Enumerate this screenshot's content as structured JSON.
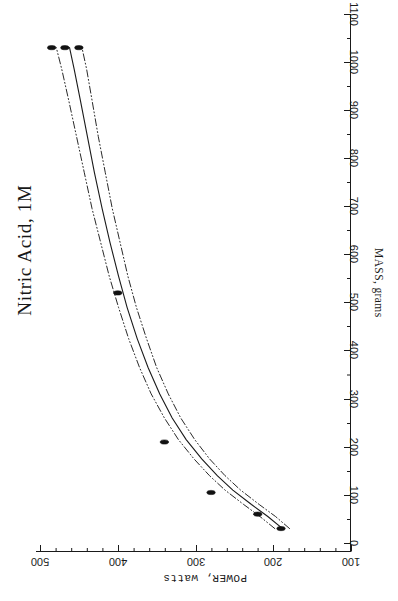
{
  "chart_data": {
    "type": "line",
    "title": "Nitric Acid, 1M",
    "xlabel": "POWER, watts",
    "ylabel": "MASS, grams",
    "orientation": "rotated-90-counterclockwise",
    "grid": false,
    "legend": "none",
    "xlabel_axis": "bottom",
    "ylabel_axis": "right",
    "xlim": [
      100,
      500
    ],
    "ylim": [
      0,
      1100
    ],
    "x_ticks": [
      500,
      400,
      300,
      200,
      100
    ],
    "x_tick_labels": [
      "500",
      "400",
      "300",
      "200",
      "100"
    ],
    "x_tick_direction": "decreasing-left-to-right",
    "y_ticks": [
      0,
      100,
      200,
      300,
      400,
      500,
      600,
      700,
      800,
      900,
      1000,
      1100
    ],
    "y_tick_labels": [
      "0",
      "100",
      "200",
      "300",
      "400",
      "500",
      "600",
      "700",
      "800",
      "900",
      "1000",
      "1100"
    ],
    "y_tick_direction": "increasing-bottom-to-top",
    "minor_ticks": true,
    "series": [
      {
        "name": "fit",
        "style": "solid",
        "color": "#1a1a1a",
        "points": [
          {
            "power": 188,
            "mass": 30
          },
          {
            "power": 207,
            "mass": 55
          },
          {
            "power": 228,
            "mass": 80
          },
          {
            "power": 252,
            "mass": 110
          },
          {
            "power": 272,
            "mass": 140
          },
          {
            "power": 292,
            "mass": 175
          },
          {
            "power": 312,
            "mass": 215
          },
          {
            "power": 330,
            "mass": 260
          },
          {
            "power": 346,
            "mass": 310
          },
          {
            "power": 361,
            "mass": 365
          },
          {
            "power": 375,
            "mass": 425
          },
          {
            "power": 388,
            "mass": 490
          },
          {
            "power": 399,
            "mass": 555
          },
          {
            "power": 410,
            "mass": 625
          },
          {
            "power": 420,
            "mass": 695
          },
          {
            "power": 430,
            "mass": 770
          },
          {
            "power": 439,
            "mass": 845
          },
          {
            "power": 448,
            "mass": 920
          },
          {
            "power": 456,
            "mass": 985
          },
          {
            "power": 462,
            "mass": 1030
          }
        ]
      },
      {
        "name": "upper-confidence-band",
        "style": "dash-dot-dot",
        "color": "#2a2a2a",
        "points": [
          {
            "power": 198,
            "mass": 30
          },
          {
            "power": 217,
            "mass": 55
          },
          {
            "power": 238,
            "mass": 80
          },
          {
            "power": 262,
            "mass": 110
          },
          {
            "power": 282,
            "mass": 140
          },
          {
            "power": 302,
            "mass": 175
          },
          {
            "power": 322,
            "mass": 215
          },
          {
            "power": 340,
            "mass": 260
          },
          {
            "power": 357,
            "mass": 310
          },
          {
            "power": 372,
            "mass": 365
          },
          {
            "power": 386,
            "mass": 425
          },
          {
            "power": 399,
            "mass": 490
          },
          {
            "power": 411,
            "mass": 555
          },
          {
            "power": 422,
            "mass": 625
          },
          {
            "power": 433,
            "mass": 695
          },
          {
            "power": 443,
            "mass": 770
          },
          {
            "power": 453,
            "mass": 845
          },
          {
            "power": 463,
            "mass": 920
          },
          {
            "power": 472,
            "mass": 985
          },
          {
            "power": 479,
            "mass": 1030
          }
        ]
      },
      {
        "name": "lower-confidence-band",
        "style": "dash-dot-dot",
        "color": "#2a2a2a",
        "points": [
          {
            "power": 179,
            "mass": 30
          },
          {
            "power": 197,
            "mass": 55
          },
          {
            "power": 218,
            "mass": 80
          },
          {
            "power": 242,
            "mass": 110
          },
          {
            "power": 262,
            "mass": 140
          },
          {
            "power": 282,
            "mass": 175
          },
          {
            "power": 301,
            "mass": 215
          },
          {
            "power": 319,
            "mass": 260
          },
          {
            "power": 335,
            "mass": 310
          },
          {
            "power": 350,
            "mass": 365
          },
          {
            "power": 363,
            "mass": 425
          },
          {
            "power": 376,
            "mass": 490
          },
          {
            "power": 387,
            "mass": 555
          },
          {
            "power": 397,
            "mass": 625
          },
          {
            "power": 407,
            "mass": 695
          },
          {
            "power": 416,
            "mass": 770
          },
          {
            "power": 425,
            "mass": 845
          },
          {
            "power": 433,
            "mass": 920
          },
          {
            "power": 440,
            "mass": 985
          },
          {
            "power": 446,
            "mass": 1030
          }
        ]
      }
    ],
    "data_points": [
      {
        "power": 190,
        "mass": 30
      },
      {
        "power": 220,
        "mass": 60
      },
      {
        "power": 280,
        "mass": 105
      },
      {
        "power": 340,
        "mass": 210
      },
      {
        "power": 400,
        "mass": 520
      },
      {
        "power": 450,
        "mass": 1030
      },
      {
        "power": 468,
        "mass": 1030
      },
      {
        "power": 485,
        "mass": 1030
      }
    ]
  },
  "axes": {
    "power": {
      "title": "POWER, watts",
      "ticks": [
        {
          "label": "500",
          "x": 40
        },
        {
          "label": "400",
          "x": 118
        },
        {
          "label": "300",
          "x": 196
        },
        {
          "label": "200",
          "x": 273
        },
        {
          "label": "100",
          "x": 351
        }
      ]
    },
    "mass": {
      "title": "MASS, grams",
      "ticks": [
        {
          "label": "1100",
          "y": 14
        },
        {
          "label": "1000",
          "y": 62
        },
        {
          "label": "900",
          "y": 110
        },
        {
          "label": "800",
          "y": 158
        },
        {
          "label": "700",
          "y": 206
        },
        {
          "label": "600",
          "y": 254
        },
        {
          "label": "500",
          "y": 302
        },
        {
          "label": "400",
          "y": 350
        },
        {
          "label": "300",
          "y": 399
        },
        {
          "label": "200",
          "y": 447
        },
        {
          "label": "100",
          "y": 495
        },
        {
          "label": "0",
          "y": 543
        }
      ]
    }
  }
}
